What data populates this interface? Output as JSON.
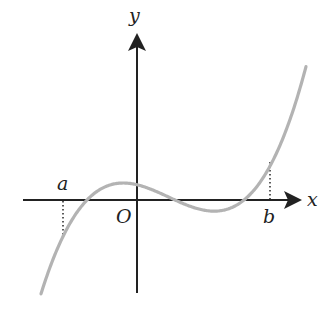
{
  "diagram": {
    "type": "function-graph",
    "colors": {
      "background": "#ffffff",
      "axis": "#222222",
      "curve": "#b3b3b3",
      "dotted": "#333333",
      "text": "#222222"
    },
    "axes": {
      "x_label": "x",
      "y_label": "y",
      "origin_label": "O"
    },
    "points": {
      "a_label": "a",
      "b_label": "b"
    },
    "curve": {
      "kind": "cubic",
      "roots_px": [
        87,
        175,
        244
      ],
      "baseline_y_px": 200,
      "scale": 7.5e-05,
      "x_start_px": 41,
      "x_end_px": 306
    }
  }
}
